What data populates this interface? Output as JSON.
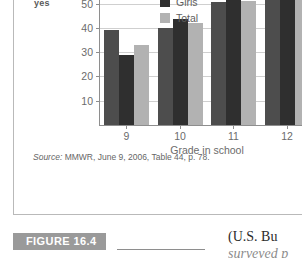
{
  "figure": {
    "tag_label": "FIGURE 16.4",
    "source_prefix": "Source:",
    "source_text": " MMWR, June 9, 2006, Table 44, p. 78."
  },
  "axis_label_fragment": "yes",
  "body_text_fragment": {
    "line1": "(U.S. Bu",
    "line2": "surveyed p"
  },
  "chart_data": {
    "type": "bar",
    "title": "",
    "xlabel": "Grade in school",
    "ylabel": "",
    "categories": [
      "9",
      "10",
      "11",
      "12"
    ],
    "series": [
      {
        "name": "Boys",
        "color": "#4d4d4d",
        "values": [
          39,
          40,
          50.5,
          62
        ]
      },
      {
        "name": "Girls",
        "color": "#2f2f2f",
        "values": [
          29,
          43.5,
          52,
          61.5
        ]
      },
      {
        "name": "Total",
        "color": "#b2b2b2",
        "values": [
          33,
          42,
          51,
          62
        ]
      }
    ],
    "legend_visible": [
      "Girls",
      "Total"
    ],
    "legend_position": "top-center",
    "yticks": [
      10,
      20,
      30,
      40,
      50,
      60
    ],
    "ylim": [
      0,
      63
    ],
    "grid": true
  }
}
